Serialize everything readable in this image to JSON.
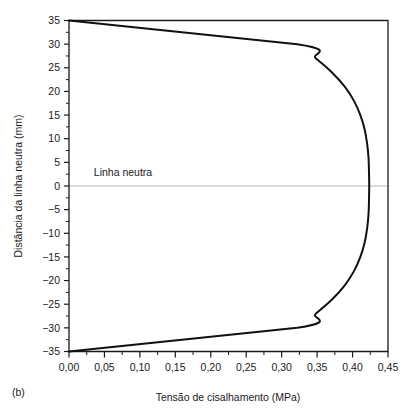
{
  "chart_data": {
    "type": "line",
    "title": "",
    "panel_label": "(b)",
    "xlabel": "Tensão de cisalhamento (MPa)",
    "ylabel": "Distância da linha neutra (mm)",
    "xlim": [
      0.0,
      0.45
    ],
    "ylim": [
      -35,
      35
    ],
    "grid": false,
    "legend": null,
    "x_ticks": [
      "0,00",
      "0,05",
      "0,10",
      "0,15",
      "0,20",
      "0,25",
      "0,30",
      "0,35",
      "0,40",
      "0,45"
    ],
    "x_tick_values": [
      0.0,
      0.05,
      0.1,
      0.15,
      0.2,
      0.25,
      0.3,
      0.35,
      0.4,
      0.45
    ],
    "x_minor_tick_values": [
      0.025,
      0.075,
      0.125,
      0.175,
      0.225,
      0.275,
      0.325,
      0.375,
      0.425
    ],
    "y_ticks": [
      "35",
      "30",
      "25",
      "20",
      "15",
      "10",
      "5",
      "0",
      "−5",
      "−10",
      "−15",
      "−20",
      "−25",
      "−30",
      "−35"
    ],
    "y_tick_values": [
      35,
      30,
      25,
      20,
      15,
      10,
      5,
      0,
      -5,
      -10,
      -15,
      -20,
      -25,
      -30,
      -35
    ],
    "y_minor_tick_values": [
      32.5,
      27.5,
      22.5,
      17.5,
      12.5,
      7.5,
      2.5,
      -2.5,
      -7.5,
      -12.5,
      -17.5,
      -22.5,
      -27.5,
      -32.5
    ],
    "annotations": [
      {
        "text": "Linha neutra",
        "x": 0.035,
        "y": 2.2,
        "kind": "neutral-axis-label"
      }
    ],
    "reference_lines": [
      {
        "orientation": "horizontal",
        "y": 0,
        "color": "#b9b9b9",
        "label": "Linha neutra"
      }
    ],
    "series": [
      {
        "name": "Tensão de cisalhamento",
        "color": "#111111",
        "points": [
          {
            "x": 0.0,
            "y": 35.0
          },
          {
            "x": 0.322,
            "y": 30.0
          },
          {
            "x": 0.348,
            "y": 27.0
          },
          {
            "x": 0.371,
            "y": 24.0
          },
          {
            "x": 0.389,
            "y": 21.0
          },
          {
            "x": 0.402,
            "y": 18.0
          },
          {
            "x": 0.411,
            "y": 15.0
          },
          {
            "x": 0.417,
            "y": 12.0
          },
          {
            "x": 0.4205,
            "y": 9.0
          },
          {
            "x": 0.4225,
            "y": 6.0
          },
          {
            "x": 0.4232,
            "y": 3.0
          },
          {
            "x": 0.4235,
            "y": 0.0
          },
          {
            "x": 0.4232,
            "y": -3.0
          },
          {
            "x": 0.4225,
            "y": -6.0
          },
          {
            "x": 0.4205,
            "y": -9.0
          },
          {
            "x": 0.417,
            "y": -12.0
          },
          {
            "x": 0.411,
            "y": -15.0
          },
          {
            "x": 0.402,
            "y": -18.0
          },
          {
            "x": 0.389,
            "y": -21.0
          },
          {
            "x": 0.371,
            "y": -24.0
          },
          {
            "x": 0.348,
            "y": -27.0
          },
          {
            "x": 0.322,
            "y": -30.0
          },
          {
            "x": 0.0,
            "y": -35.0
          }
        ]
      }
    ]
  }
}
